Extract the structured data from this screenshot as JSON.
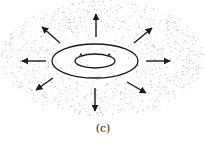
{
  "figure": {
    "caption": "(c)",
    "colors": {
      "stroke": "#1a1a1a",
      "stipple": "#b8b8b8",
      "background": "#ffffff"
    },
    "outer_ellipse": {
      "cx": 95,
      "cy": 61,
      "rx": 43,
      "ry": 17
    },
    "inner_ellipse": {
      "cx": 95,
      "cy": 61,
      "rx": 20,
      "ry": 7
    },
    "stipple_region": {
      "cx": 103,
      "cy": 58,
      "rx": 102,
      "ry": 58
    },
    "arrows": [
      {
        "direction": "up",
        "x1": 96,
        "y1": 37,
        "x2": 96,
        "y2": 14
      },
      {
        "direction": "up-right",
        "x1": 134,
        "y1": 43,
        "x2": 152,
        "y2": 28
      },
      {
        "direction": "right",
        "x1": 146,
        "y1": 61,
        "x2": 170,
        "y2": 61
      },
      {
        "direction": "down-right",
        "x1": 127,
        "y1": 82,
        "x2": 146,
        "y2": 93
      },
      {
        "direction": "down",
        "x1": 95,
        "y1": 88,
        "x2": 95,
        "y2": 111
      },
      {
        "direction": "down-left",
        "x1": 53,
        "y1": 78,
        "x2": 36,
        "y2": 90
      },
      {
        "direction": "left",
        "x1": 46,
        "y1": 61,
        "x2": 22,
        "y2": 61
      },
      {
        "direction": "up-left",
        "x1": 60,
        "y1": 43,
        "x2": 42,
        "y2": 27
      }
    ]
  }
}
